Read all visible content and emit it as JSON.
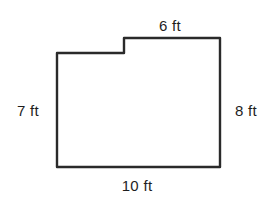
{
  "diagram": {
    "type": "floor-plan-outline",
    "stroke_color": "#2a2a2a",
    "background_color": "#ffffff",
    "shape": {
      "points": [
        [
          57,
          53
        ],
        [
          124,
          53
        ],
        [
          124,
          38
        ],
        [
          220,
          38
        ],
        [
          220,
          167
        ],
        [
          57,
          167
        ]
      ],
      "stroke_width": 2.4
    },
    "labels": {
      "top": {
        "text": "6 ft",
        "x": 170,
        "y": 25
      },
      "left": {
        "text": "7 ft",
        "x": 28,
        "y": 110
      },
      "right": {
        "text": "8 ft",
        "x": 246,
        "y": 110
      },
      "bottom": {
        "text": "10 ft",
        "x": 137,
        "y": 185
      }
    }
  }
}
